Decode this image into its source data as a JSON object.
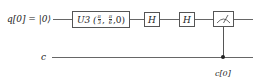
{
  "circuit": {
    "qubits": [
      {
        "label": "q[0] = |0⟩"
      }
    ],
    "classical": [
      {
        "label": "c"
      }
    ],
    "gates": [
      {
        "name": "U3",
        "params_display": [
          "π/3",
          "π/6",
          "0"
        ],
        "label_prefix": "U3 (",
        "p1_num": "π",
        "p1_den": "3",
        "p2_num": "π",
        "p2_den": "6",
        "p3": "0",
        "label_suffix": ")"
      },
      {
        "name": "H",
        "label": "H"
      },
      {
        "name": "H",
        "label": "H"
      },
      {
        "name": "measure",
        "label": "",
        "target_label": "c[0]"
      }
    ],
    "colors": {
      "wire": "#666666",
      "gate_border": "#555555",
      "background": "#ffffff"
    }
  }
}
